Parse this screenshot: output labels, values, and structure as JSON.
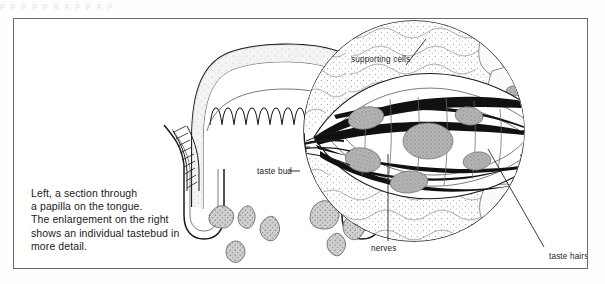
{
  "page": {
    "top_artifact_text": "p  p  p  p    p    g      g           p         p              g       p"
  },
  "figure": {
    "caption_lines": [
      "Left, a section through",
      "a papilla on the tongue.",
      "The enlargement on the right",
      "shows an individual tastebud in",
      "more detail."
    ],
    "labels": {
      "taste_bud": "taste bud",
      "supporting_cells": "supporting cells",
      "nerves": "nerves",
      "taste_hairs": "taste hairs"
    },
    "colors": {
      "ink": "#1a1a1a",
      "frame": "#6b6b6b",
      "tissue_fill": "#f2f2f2",
      "nucleus_fill": "#9e9e9e",
      "gland_fill": "#bdbdbd",
      "paper": "#ffffff"
    },
    "panels": {
      "left": "section-through-papilla-on-tongue",
      "right": "enlarged-individual-taste-bud"
    }
  }
}
